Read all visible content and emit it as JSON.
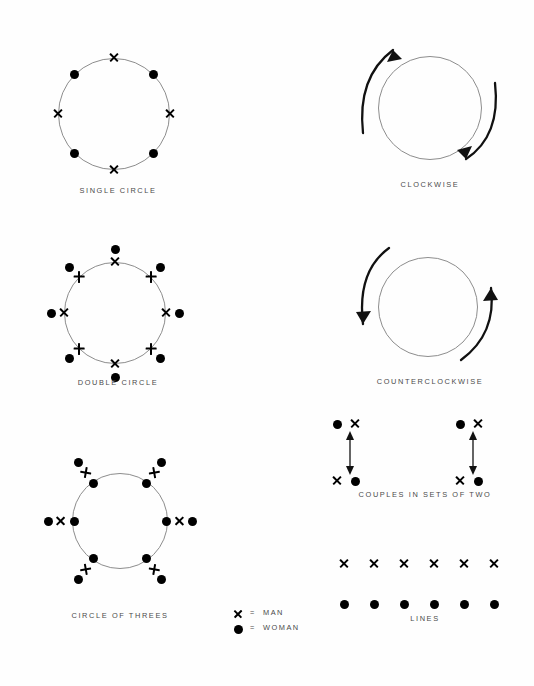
{
  "page": {
    "background": "#fefefe",
    "ink": "#000000",
    "ring_color": "#8d8d8d",
    "caption_color": "#4a4a4a"
  },
  "legend": {
    "name": "symbol-legend",
    "rows": [
      {
        "symbol": "x",
        "equals": "=",
        "label": "MAN"
      },
      {
        "symbol": "dot",
        "equals": "=",
        "label": "WOMAN"
      }
    ]
  },
  "figures": [
    {
      "id": "single-circle",
      "caption": "SINGLE CIRCLE",
      "type": "circle-formation",
      "markers": [
        {
          "kind": "x",
          "angle": 270
        },
        {
          "kind": "dot",
          "angle": 315
        },
        {
          "kind": "x",
          "angle": 0
        },
        {
          "kind": "dot",
          "angle": 45
        },
        {
          "kind": "x",
          "angle": 90
        },
        {
          "kind": "dot",
          "angle": 135
        },
        {
          "kind": "x",
          "angle": 180
        },
        {
          "kind": "dot",
          "angle": 225
        }
      ]
    },
    {
      "id": "double-circle",
      "caption": "DOUBLE CIRCLE",
      "type": "circle-formation",
      "pairs": [
        {
          "angle": 270,
          "inner": "x",
          "outer": "dot"
        },
        {
          "angle": 315,
          "inner": "x-plus",
          "outer": "dot"
        },
        {
          "angle": 0,
          "inner": "x",
          "outer": "dot"
        },
        {
          "angle": 45,
          "inner": "x-plus",
          "outer": "dot"
        },
        {
          "angle": 90,
          "inner": "x",
          "outer": "dot"
        },
        {
          "angle": 135,
          "inner": "x-plus",
          "outer": "dot"
        },
        {
          "angle": 180,
          "inner": "x",
          "outer": "dot"
        },
        {
          "angle": 225,
          "inner": "x-plus",
          "outer": "dot"
        }
      ]
    },
    {
      "id": "circle-of-threes",
      "caption": "CIRCLE OF THREES",
      "type": "circle-formation",
      "trios": [
        {
          "angle": 180,
          "sequence": [
            "dot",
            "x",
            "dot"
          ]
        },
        {
          "angle": 0,
          "sequence": [
            "dot",
            "x",
            "dot"
          ]
        },
        {
          "angle": 235,
          "sequence": [
            "dot",
            "x",
            "dot"
          ]
        },
        {
          "angle": 305,
          "sequence": [
            "dot",
            "x",
            "dot"
          ]
        },
        {
          "angle": 125,
          "sequence": [
            "dot",
            "x",
            "dot"
          ]
        },
        {
          "angle": 55,
          "sequence": [
            "dot",
            "x",
            "dot"
          ]
        }
      ]
    },
    {
      "id": "clockwise",
      "caption": "CLOCKWISE",
      "type": "rotation-arrows",
      "direction": "clockwise",
      "arrows": [
        {
          "name": "left-arc-arrow",
          "points_to": "up"
        },
        {
          "name": "right-arc-arrow",
          "points_to": "down"
        }
      ]
    },
    {
      "id": "counterclockwise",
      "caption": "COUNTERCLOCKWISE",
      "type": "rotation-arrows",
      "direction": "counterclockwise",
      "arrows": [
        {
          "name": "left-arc-arrow",
          "points_to": "down"
        },
        {
          "name": "right-arc-arrow",
          "points_to": "up"
        }
      ]
    },
    {
      "id": "couples-in-sets-of-two",
      "caption": "COUPLES IN SETS OF TWO",
      "type": "couples",
      "sets": [
        {
          "top": [
            "dot",
            "x"
          ],
          "bottom": [
            "x",
            "dot"
          ],
          "connector": "double-headed-vertical-arrow"
        },
        {
          "top": [
            "dot",
            "x"
          ],
          "bottom": [
            "x",
            "dot"
          ],
          "connector": "double-headed-vertical-arrow"
        }
      ]
    },
    {
      "id": "lines",
      "caption": "LINES",
      "type": "lines",
      "rows": [
        {
          "kind": "x",
          "count": 6
        },
        {
          "kind": "dot",
          "count": 6
        }
      ]
    }
  ]
}
